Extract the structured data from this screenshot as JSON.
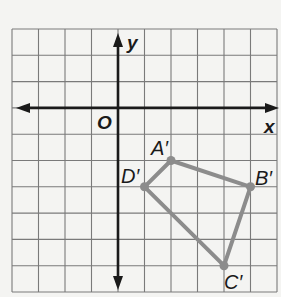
{
  "diagram": {
    "type": "coordinate-grid",
    "grid": {
      "x_min": -4,
      "x_max": 6,
      "y_min": -7,
      "y_max": 3,
      "left_px": 12,
      "top_px": 29,
      "cell_w": 26.5,
      "cell_h": 26.3,
      "line_color": "#7a7a7a",
      "axis_color": "#1a1a1a"
    },
    "axes": {
      "x_label": "x",
      "y_label": "y",
      "origin_label": "O"
    },
    "polygon": {
      "color": "#8c8c8c",
      "vertices": [
        {
          "name": "A′",
          "x": 2,
          "y": -2
        },
        {
          "name": "B′",
          "x": 5,
          "y": -3
        },
        {
          "name": "C′",
          "x": 4,
          "y": -6
        },
        {
          "name": "D′",
          "x": 1,
          "y": -3
        }
      ]
    }
  }
}
